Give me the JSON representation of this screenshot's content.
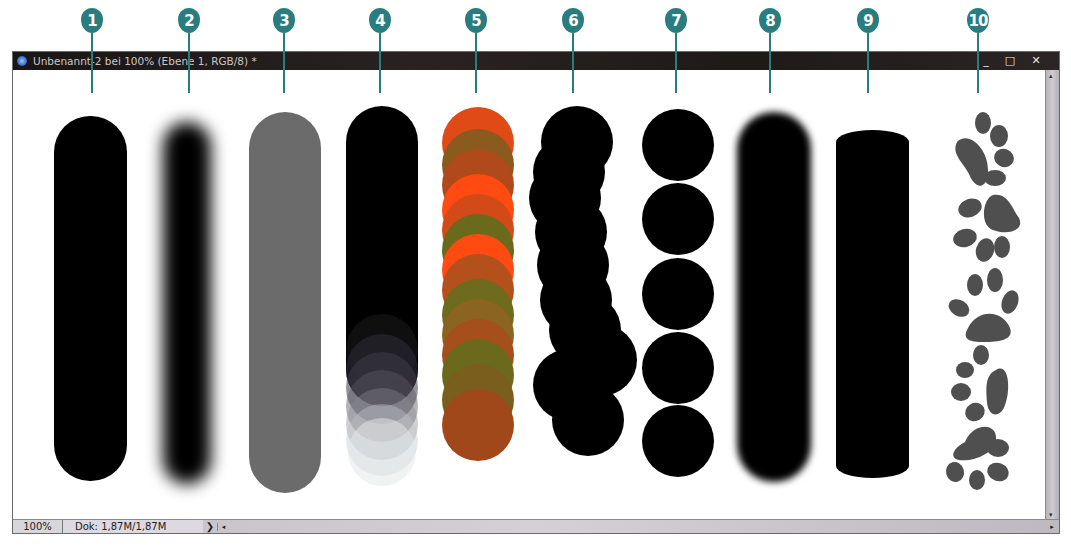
{
  "callouts": [
    {
      "num": "1",
      "x": 92
    },
    {
      "num": "2",
      "x": 189
    },
    {
      "num": "3",
      "x": 284
    },
    {
      "num": "4",
      "x": 380
    },
    {
      "num": "5",
      "x": 476
    },
    {
      "num": "6",
      "x": 573
    },
    {
      "num": "7",
      "x": 676
    },
    {
      "num": "8",
      "x": 770
    },
    {
      "num": "9",
      "x": 868
    },
    {
      "num": "10",
      "x": 978
    }
  ],
  "window": {
    "title": "Unbenannt-2 bei 100% (Ebene 1, RGB/8) *",
    "controls": {
      "minimize": "_",
      "maximize": "□",
      "close": "✕"
    }
  },
  "statusbar": {
    "zoom": "100%",
    "doc_size": "Dok: 1,87M/1,87M",
    "more_arrow": "❯",
    "scroll_left_arrow": "◂",
    "scroll_right_arrow": "▸"
  },
  "scrollbar": {
    "up_arrow": "▴",
    "down_arrow": "▾"
  },
  "colors": {
    "callout": "#2a7d7f",
    "stroke_black": "#000000",
    "stroke_gray": "#6b6b6b",
    "stroke_orange": "#ff4a12",
    "stroke_olive": "#6b6a1c",
    "paw_gray": "#4f4f4f"
  },
  "strokes": [
    {
      "id": "1",
      "type": "hard-round"
    },
    {
      "id": "2",
      "type": "soft-round"
    },
    {
      "id": "3",
      "type": "gray-round"
    },
    {
      "id": "4",
      "type": "fade-opacity"
    },
    {
      "id": "5",
      "type": "color-dynamics"
    },
    {
      "id": "6",
      "type": "scatter"
    },
    {
      "id": "7",
      "type": "spacing"
    },
    {
      "id": "8",
      "type": "soft-edge"
    },
    {
      "id": "9",
      "type": "angle-roundness"
    },
    {
      "id": "10",
      "type": "paw-prints"
    }
  ]
}
